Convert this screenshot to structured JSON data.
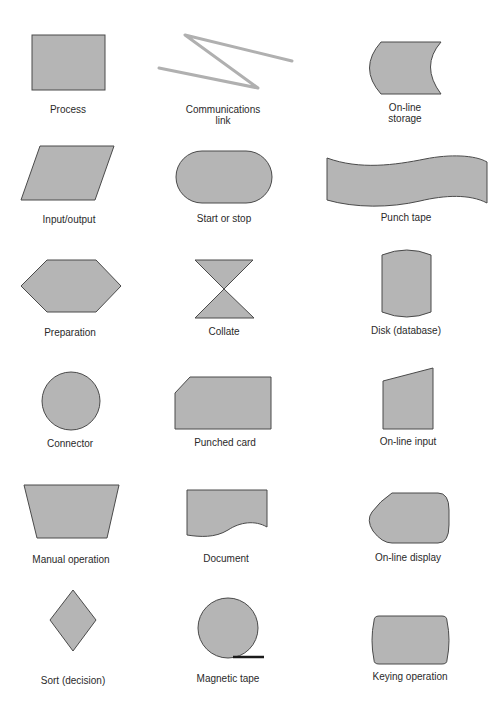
{
  "figure": {
    "colors": {
      "fill": "#b5b5b5",
      "stroke": "#4a4a4a",
      "link": "#b0b0b0",
      "text": "#2a2a2a"
    },
    "symbols": [
      {
        "id": "process",
        "label": "Process",
        "shape": "rectangle"
      },
      {
        "id": "communications-link",
        "label": "Communications\nlink",
        "shape": "zigzag"
      },
      {
        "id": "online-storage",
        "label": "On-line\nstorage",
        "shape": "concave-arc-box"
      },
      {
        "id": "input-output",
        "label": "Input/output",
        "shape": "parallelogram"
      },
      {
        "id": "start-stop",
        "label": "Start or stop",
        "shape": "stadium"
      },
      {
        "id": "punch-tape",
        "label": "Punch tape",
        "shape": "wavy-band"
      },
      {
        "id": "preparation",
        "label": "Preparation",
        "shape": "hexagon"
      },
      {
        "id": "collate",
        "label": "Collate",
        "shape": "hourglass"
      },
      {
        "id": "disk",
        "label": "Disk (database)",
        "shape": "cylinder"
      },
      {
        "id": "connector",
        "label": "Connector",
        "shape": "circle"
      },
      {
        "id": "punched-card",
        "label": "Punched card",
        "shape": "clipped-rectangle"
      },
      {
        "id": "online-input",
        "label": "On-line input",
        "shape": "sloped-top-quad"
      },
      {
        "id": "manual-operation",
        "label": "Manual operation",
        "shape": "trapezoid"
      },
      {
        "id": "document",
        "label": "Document",
        "shape": "wavy-bottom-rect"
      },
      {
        "id": "online-display",
        "label": "On-line display",
        "shape": "display"
      },
      {
        "id": "sort",
        "label": "Sort (decision)",
        "shape": "diamond"
      },
      {
        "id": "magnetic-tape",
        "label": "Magnetic tape",
        "shape": "circle-with-tail"
      },
      {
        "id": "keying-operation",
        "label": "Keying operation",
        "shape": "bulged-rectangle"
      }
    ]
  }
}
